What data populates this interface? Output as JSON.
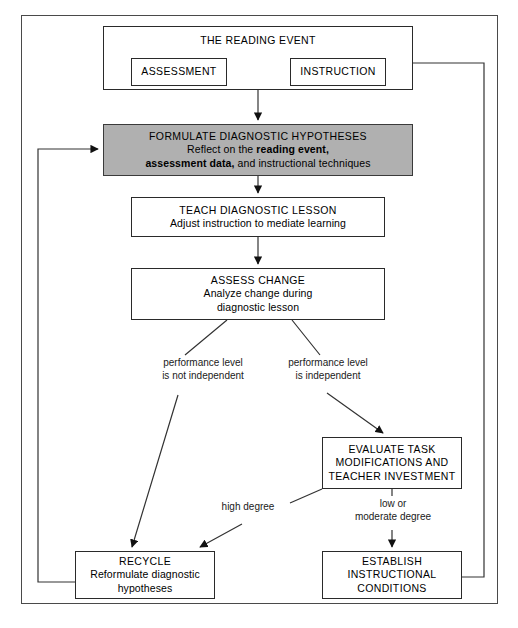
{
  "diagram": {
    "nodes": {
      "reading_event": {
        "title": "THE READING EVENT"
      },
      "assessment": {
        "title": "ASSESSMENT"
      },
      "instruction": {
        "title": "INSTRUCTION"
      },
      "formulate": {
        "title": "FORMULATE DIAGNOSTIC HYPOTHESES",
        "line2_pre": "Reflect on the ",
        "line2_bold": "reading event,",
        "line3_bold": "assessment data,",
        "line3_post": " and instructional techniques"
      },
      "teach": {
        "title": "TEACH DIAGNOSTIC LESSON",
        "line2": "Adjust instruction to mediate learning"
      },
      "assess": {
        "title": "ASSESS CHANGE",
        "line2": "Analyze change during",
        "line3": "diagnostic lesson"
      },
      "evaluate": {
        "line1": "EVALUATE TASK",
        "line2": "MODIFICATIONS AND",
        "line3": "TEACHER INVESTMENT"
      },
      "recycle": {
        "title": "RECYCLE",
        "line2": "Reformulate diagnostic",
        "line3": "hypotheses"
      },
      "establish": {
        "line1": "ESTABLISH",
        "line2": "INSTRUCTIONAL",
        "line3": "CONDITIONS"
      }
    },
    "edge_labels": {
      "not_independent": {
        "line1": "performance level",
        "line2": "is not independent"
      },
      "independent": {
        "line1": "performance level",
        "line2": "is independent"
      },
      "high_degree": {
        "line1": "high degree"
      },
      "low_moderate": {
        "line1": "low or",
        "line2": "moderate degree"
      }
    },
    "colors": {
      "highlight_fill": "#b0b0b0",
      "stroke": "#2a2a2a",
      "frame": "#4a4a4a",
      "background": "#ffffff"
    }
  }
}
